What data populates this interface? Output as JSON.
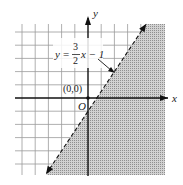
{
  "chart_data": {
    "type": "inequality_graph",
    "title": "",
    "equation_label": {
      "lhs": "y",
      "eq": "=",
      "frac_num": "3",
      "frac_den": "2",
      "rhs": "x − 1"
    },
    "boundary_line": {
      "slope": 1.5,
      "intercept": -1,
      "style": "dashed"
    },
    "shaded_region": "below-right of line (y < 3/2 x − 1)",
    "test_point": {
      "label": "(0,0)",
      "x": 0,
      "y": 0
    },
    "origin_label": "O",
    "xlabel": "x",
    "ylabel": "y",
    "xlim": [
      -5,
      6
    ],
    "ylim": [
      -6,
      5
    ],
    "grid": true
  },
  "colors": {
    "grid": "#9a9a9a",
    "axis": "#111111",
    "shade": "#b8b8b8",
    "line": "#111111"
  }
}
